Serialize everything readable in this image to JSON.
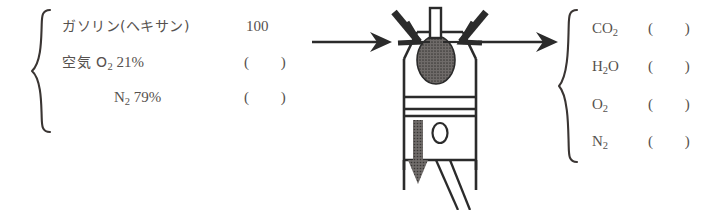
{
  "figure": {
    "ink_color": "#2b2b2b",
    "text_color": "#56514e"
  },
  "reactants": {
    "brace": "{",
    "rows": [
      {
        "name_main": "ガソリン(ヘキサン)",
        "sub": "",
        "tail": "",
        "value": "100"
      },
      {
        "name_main": "空気 O",
        "sub": "2",
        "tail": " 21%",
        "value": "(        )"
      },
      {
        "name_main": "N",
        "sub": "2",
        "tail": " 79%",
        "value": "(        )"
      }
    ]
  },
  "products": {
    "brace": "{",
    "rows": [
      {
        "name_main": "CO",
        "sub": "2",
        "tail": "",
        "value": "(        )"
      },
      {
        "name_main": "H",
        "sub": "2",
        "tail": "O",
        "value": "(        )"
      },
      {
        "name_main": "O",
        "sub": "2",
        "tail": "",
        "value": "(        )"
      },
      {
        "name_main": "N",
        "sub": "2",
        "tail": "",
        "value": "(        )"
      }
    ]
  },
  "arrows": {
    "inlet": "arrow-right",
    "outlet": "arrow-right"
  },
  "engine": {
    "parts": [
      "intake-valve",
      "exhaust-valve",
      "spark-plug",
      "combustion-flame",
      "cylinder-head",
      "cylinder-wall",
      "piston",
      "piston-rings",
      "piston-pin",
      "connecting-rod",
      "downward-motion-arrow"
    ]
  }
}
